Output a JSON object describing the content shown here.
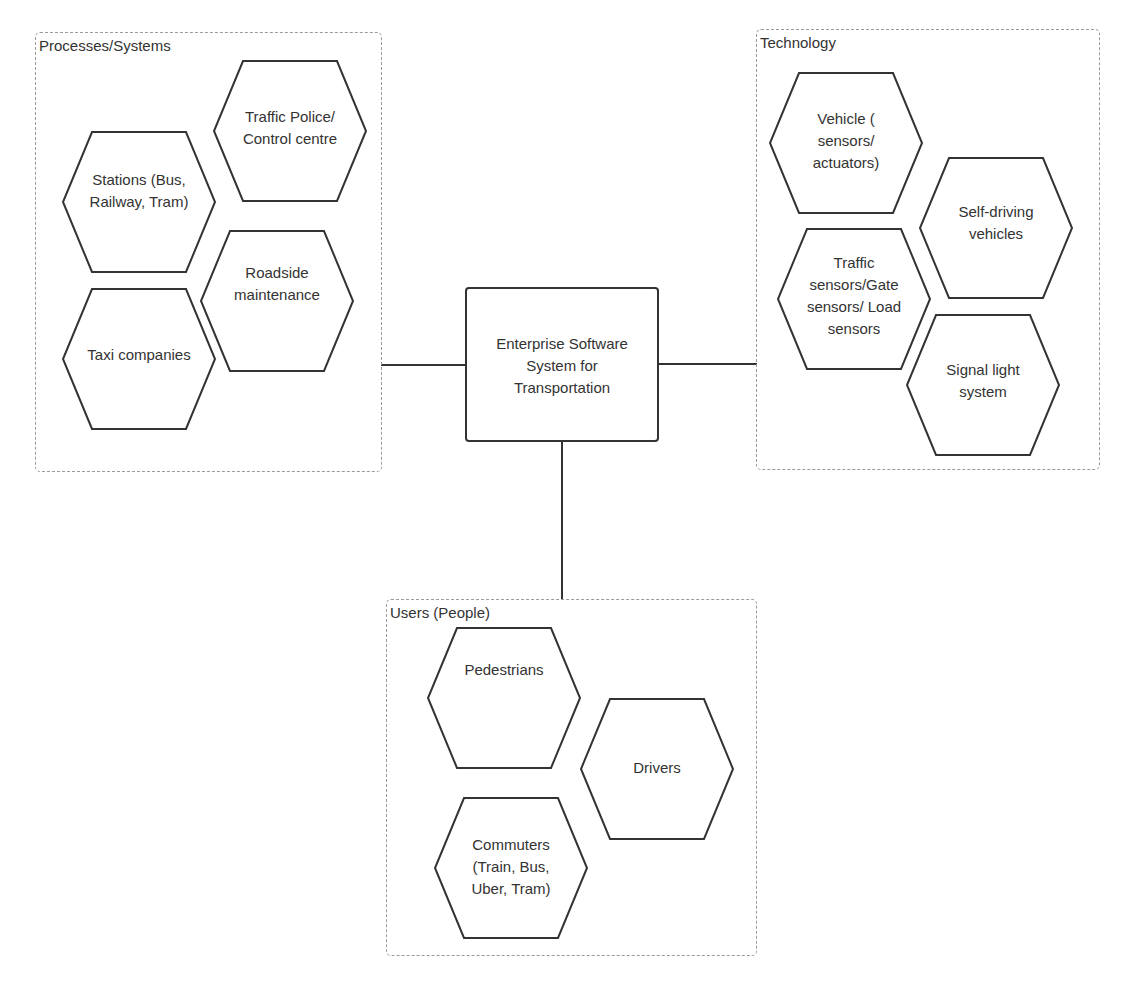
{
  "center": {
    "label": "Enterprise Software\nSystem for\nTransportation"
  },
  "groups": {
    "processes": {
      "title": "Processes/Systems",
      "items": [
        "Traffic Police/\nControl centre",
        "Stations (Bus,\nRailway, Tram)",
        "Roadside\nmaintenance",
        "Taxi companies"
      ]
    },
    "technology": {
      "title": "Technology",
      "items": [
        "Vehicle (\nsensors/\nactuators)",
        "Self-driving\nvehicles",
        "Traffic\nsensors/Gate\nsensors/ Load\nsensors",
        "Signal light\nsystem"
      ]
    },
    "users": {
      "title": "Users (People)",
      "items": [
        "Pedestrians",
        "Drivers",
        "Commuters\n(Train, Bus,\nUber, Tram)"
      ]
    }
  },
  "colors": {
    "stroke": "#333333",
    "group_border": "#9a9a9a",
    "text": "#333333"
  }
}
